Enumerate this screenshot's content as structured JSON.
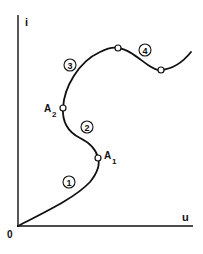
{
  "diagram": {
    "axes": {
      "y_label": "i",
      "x_label": "u",
      "origin_label": "0"
    },
    "points": [
      {
        "id": "A1",
        "base": "A",
        "sub": "1"
      },
      {
        "id": "A2",
        "base": "A",
        "sub": "2"
      }
    ],
    "segments": [
      {
        "id": "1",
        "label": "1"
      },
      {
        "id": "2",
        "label": "2"
      },
      {
        "id": "3",
        "label": "3"
      },
      {
        "id": "4",
        "label": "4"
      }
    ],
    "colors": {
      "line": "#111111",
      "background": "#ffffff"
    }
  }
}
